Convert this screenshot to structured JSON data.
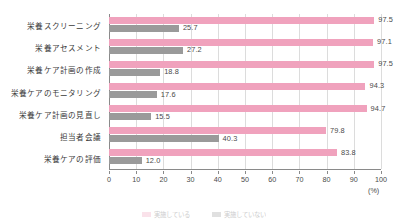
{
  "chart_data": {
    "type": "bar",
    "orientation": "horizontal",
    "title": "",
    "xlabel": "(%)",
    "ylabel": "",
    "xlim": [
      0,
      100
    ],
    "xticks": [
      0,
      10,
      20,
      30,
      40,
      50,
      60,
      70,
      80,
      90,
      100
    ],
    "grid": true,
    "grid_axis": "x",
    "legend_position": "bottom",
    "categories": [
      "栄養スクリーニング",
      "栄養アセスメント",
      "栄養ケア計画の作成",
      "栄養ケアのモニタリング",
      "栄養ケア計画の見直し",
      "担当者会議",
      "栄養ケアの評価"
    ],
    "series": [
      {
        "name": "実施している",
        "color": "#f0a2bd",
        "values": [
          97.5,
          97.1,
          97.5,
          94.3,
          94.7,
          79.8,
          83.8
        ],
        "labels": [
          "97.5",
          "97.1",
          "97.5",
          "94.3",
          "94.7",
          "79.8",
          "83.8"
        ]
      },
      {
        "name": "実施していない",
        "color": "#9a9a9a",
        "values": [
          25.7,
          27.2,
          18.8,
          17.6,
          15.5,
          40.3,
          12.0
        ],
        "labels": [
          "25.7",
          "27.2",
          "18.8",
          "17.6",
          "15.5",
          "40.3",
          "12.0"
        ]
      }
    ]
  },
  "axis": {
    "unit_label": "(%)",
    "tick_labels": [
      "0",
      "10",
      "20",
      "30",
      "40",
      "50",
      "60",
      "70",
      "80",
      "90",
      "100"
    ]
  },
  "colors": {
    "series_primary": "#f0a2bd",
    "series_secondary": "#9a9a9a",
    "grid": "#dcdcdc",
    "axis": "#8a8a8a",
    "text": "#3a3a3a",
    "background": "#ffffff"
  }
}
